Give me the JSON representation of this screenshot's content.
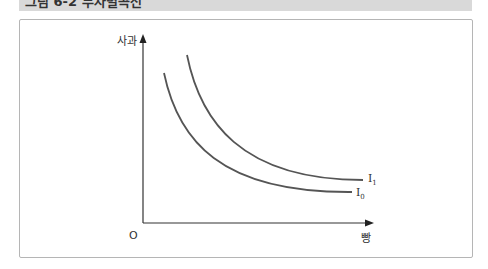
{
  "figure": {
    "title": "그림 6-2 무차별곡선"
  },
  "diagram": {
    "y_axis_label": "사과",
    "x_axis_label": "빵",
    "origin_label": "O",
    "curves": [
      {
        "name": "I",
        "subscript": "1"
      },
      {
        "name": "I",
        "subscript": "0"
      }
    ],
    "colors": {
      "curve": "#555555",
      "axis": "#333333",
      "frame": "#b5b5b5",
      "header": "#d9d9d9"
    }
  }
}
